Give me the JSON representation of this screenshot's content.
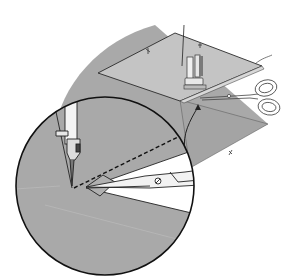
{
  "illustration": {
    "subject": "sewing-trim-seam-allowance",
    "alt": "Sewing machine presser foot stitching fabric with scissors trimming the corner; magnified inset circle shows needle, stitch line and scissors cutting",
    "colors": {
      "background": "#ffffff",
      "fabric_dark": "#a9a9a9",
      "fabric_light": "#c4c4c4",
      "outline": "#1a1a1a",
      "metal": "#f2f2f2"
    }
  }
}
